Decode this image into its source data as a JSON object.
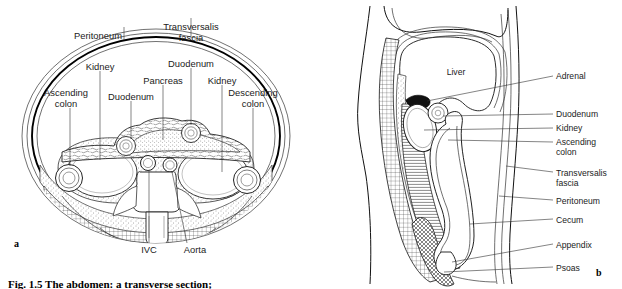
{
  "figure": {
    "caption": "Fig. 1.5 The abdomen: a transverse section;",
    "panel_a_letter": "a",
    "panel_b_letter": "b"
  },
  "panel_a": {
    "name": "transverse-section",
    "labels": [
      {
        "id": "peritoneum",
        "text": "Peritoneum",
        "x": 98,
        "y": 35,
        "anchor": "middle",
        "leader": [
          [
            124,
            39
          ],
          [
            124,
            27
          ]
        ]
      },
      {
        "id": "transversalis",
        "text": "Transversalis",
        "x": 186,
        "y": 30,
        "anchor": "middle",
        "leader": [
          [
            190,
            34
          ],
          [
            190,
            20
          ]
        ]
      },
      {
        "id": "transversalis2",
        "text": "fascia",
        "x": 186,
        "y": 41,
        "anchor": "middle",
        "leader": null
      },
      {
        "id": "kidney-left",
        "text": "Kidney",
        "x": 92,
        "y": 66,
        "anchor": "middle",
        "leader": [
          [
            100,
            70
          ],
          [
            100,
            164
          ]
        ]
      },
      {
        "id": "duodenum-top",
        "text": "Duodenum",
        "x": 188,
        "y": 63,
        "anchor": "middle",
        "leader": [
          [
            190,
            67
          ],
          [
            190,
            130
          ]
        ]
      },
      {
        "id": "pancreas",
        "text": "Pancreas",
        "x": 163,
        "y": 80,
        "anchor": "middle",
        "leader": [
          [
            163,
            84
          ],
          [
            163,
            141
          ]
        ]
      },
      {
        "id": "kidney-right",
        "text": "Kidney",
        "x": 222,
        "y": 80,
        "anchor": "middle",
        "leader": [
          [
            222,
            84
          ],
          [
            222,
            178
          ]
        ]
      },
      {
        "id": "duodenum-left",
        "text": "Duodenum",
        "x": 131,
        "y": 96,
        "anchor": "middle",
        "leader": [
          [
            131,
            100
          ],
          [
            131,
            143
          ]
        ]
      },
      {
        "id": "ascending-colon-1",
        "text": "Ascending",
        "x": 63,
        "y": 92,
        "anchor": "middle",
        "leader": [
          [
            70,
            107
          ],
          [
            70,
            172
          ]
        ]
      },
      {
        "id": "ascending-colon-2",
        "text": "colon",
        "x": 63,
        "y": 103,
        "anchor": "middle",
        "leader": null
      },
      {
        "id": "descending-colon-1",
        "text": "Descending",
        "x": 254,
        "y": 92,
        "anchor": "middle",
        "leader": null
      },
      {
        "id": "descending-colon-2",
        "text": "colon",
        "x": 254,
        "y": 103,
        "anchor": "middle",
        "leader": null
      },
      {
        "id": "ivc",
        "text": "IVC",
        "x": 149,
        "y": 252,
        "anchor": "middle",
        "leader": [
          [
            154,
            156
          ],
          [
            154,
            244
          ]
        ]
      },
      {
        "id": "aorta",
        "text": "Aorta",
        "x": 193,
        "y": 252,
        "anchor": "middle",
        "leader": [
          [
            178,
            156
          ],
          [
            186,
            244
          ]
        ]
      }
    ]
  },
  "panel_b": {
    "name": "sagittal-section",
    "labels": [
      {
        "id": "liver",
        "text": "Liver",
        "x": 456,
        "y": 72,
        "anchor": "middle",
        "leader": null
      },
      {
        "id": "adrenal",
        "text": "Adrenal",
        "x": 558,
        "y": 79,
        "anchor": "start",
        "leader": [
          [
            530,
            76
          ],
          [
            555,
            76
          ]
        ]
      },
      {
        "id": "duodenum",
        "text": "Duodenum",
        "x": 558,
        "y": 117,
        "anchor": "start",
        "leader": [
          [
            530,
            114
          ],
          [
            555,
            114
          ]
        ]
      },
      {
        "id": "kidney",
        "text": "Kidney",
        "x": 558,
        "y": 131,
        "anchor": "start",
        "leader": [
          [
            530,
            128
          ],
          [
            555,
            128
          ]
        ]
      },
      {
        "id": "ascending-colon-1",
        "text": "Ascending",
        "x": 558,
        "y": 145,
        "anchor": "start",
        "leader": [
          [
            530,
            142
          ],
          [
            555,
            142
          ]
        ]
      },
      {
        "id": "ascending-colon-2",
        "text": "colon",
        "x": 558,
        "y": 155,
        "anchor": "start",
        "leader": null
      },
      {
        "id": "transversalis-1",
        "text": "Transversalis",
        "x": 558,
        "y": 175,
        "anchor": "start",
        "leader": [
          [
            530,
            172
          ],
          [
            555,
            172
          ]
        ]
      },
      {
        "id": "transversalis-2",
        "text": "fascia",
        "x": 558,
        "y": 186,
        "anchor": "start",
        "leader": null
      },
      {
        "id": "peritoneum",
        "text": "Peritoneum",
        "x": 558,
        "y": 203,
        "anchor": "start",
        "leader": [
          [
            530,
            200
          ],
          [
            555,
            200
          ]
        ]
      },
      {
        "id": "cecum",
        "text": "Cecum",
        "x": 558,
        "y": 222,
        "anchor": "start",
        "leader": [
          [
            530,
            219
          ],
          [
            555,
            219
          ]
        ]
      },
      {
        "id": "appendix",
        "text": "Appendix",
        "x": 558,
        "y": 247,
        "anchor": "start",
        "leader": [
          [
            530,
            244
          ],
          [
            555,
            244
          ]
        ]
      },
      {
        "id": "psoas",
        "text": "Psoas",
        "x": 558,
        "y": 270,
        "anchor": "start",
        "leader": [
          [
            530,
            267
          ],
          [
            555,
            267
          ]
        ]
      }
    ]
  },
  "colors": {
    "ink": "#1a1a1a",
    "line": "#333333",
    "background": "#ffffff"
  }
}
